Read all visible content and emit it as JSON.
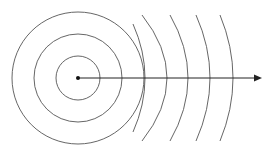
{
  "diagram": {
    "title": "",
    "center": {
      "x": 78,
      "y": 78
    },
    "circles": [
      {
        "r": 22
      },
      {
        "r": 44
      },
      {
        "r": 66
      }
    ],
    "arcs": [
      {
        "axis_x": 145,
        "top_x": 133,
        "top_y": 24,
        "bottom_x": 133,
        "bottom_y": 132
      },
      {
        "axis_x": 167,
        "top_x": 142,
        "top_y": 15,
        "bottom_x": 142,
        "bottom_y": 141
      },
      {
        "axis_x": 188,
        "top_x": 170,
        "top_y": 15,
        "bottom_x": 170,
        "bottom_y": 141
      },
      {
        "axis_x": 210,
        "top_x": 196,
        "top_y": 15,
        "bottom_x": 196,
        "bottom_y": 141
      },
      {
        "axis_x": 233,
        "top_x": 220,
        "top_y": 15,
        "bottom_x": 220,
        "bottom_y": 141
      }
    ],
    "arrow": {
      "x1": 78,
      "y1": 78,
      "x2": 262,
      "y2": 78
    },
    "colors": {
      "stroke": "#555555",
      "arrow": "#222222",
      "dot": "#111111"
    }
  }
}
